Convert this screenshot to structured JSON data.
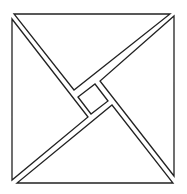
{
  "diagram": {
    "title": "",
    "pieces": [
      {
        "name": "top-triangle"
      },
      {
        "name": "right-triangle"
      },
      {
        "name": "bottom-triangle"
      },
      {
        "name": "left-triangle"
      },
      {
        "name": "center-square"
      }
    ],
    "colors": {
      "stroke": "#222222",
      "fill": "#ffffff"
    }
  }
}
